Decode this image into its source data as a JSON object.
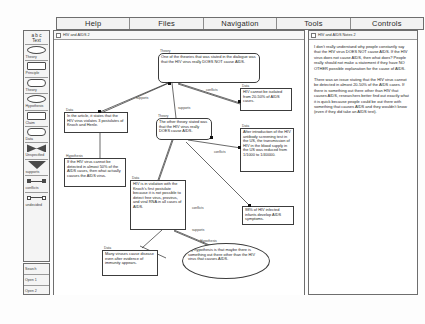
{
  "menubar": {
    "items": [
      {
        "label": "Help",
        "name": "menu-help"
      },
      {
        "label": "Files",
        "name": "menu-files"
      },
      {
        "label": "Navigation",
        "name": "menu-navigation"
      },
      {
        "label": "Tools",
        "name": "menu-tools"
      },
      {
        "label": "Controls",
        "name": "menu-controls"
      }
    ]
  },
  "palette": {
    "header": "a b c\nText",
    "header_line1": "a b c",
    "header_line2": "Text",
    "items": [
      {
        "label": "Theory",
        "shape": "oval"
      },
      {
        "label": "Principle",
        "shape": "rect"
      },
      {
        "label": "Theory",
        "shape": "round"
      },
      {
        "label": "Hypothesis",
        "shape": "oval"
      },
      {
        "label": "Claim",
        "shape": "rect"
      },
      {
        "label": "Data",
        "shape": "round"
      },
      {
        "label": "Unspecified",
        "shape": "bowtie"
      },
      {
        "label": "supports",
        "shape": "triangle"
      },
      {
        "label": "conflicts",
        "shape": "link-filled"
      },
      {
        "label": "undecided",
        "shape": "link-open"
      }
    ],
    "bottom_items": [
      {
        "label": "Search"
      },
      {
        "label": "Open 1"
      },
      {
        "label": "Open 2"
      }
    ]
  },
  "map_window": {
    "title": "HIV and AIDS 2",
    "nodes": [
      {
        "id": "theory-not-cause",
        "tag": "Theory",
        "shape": "rounded",
        "text": "One of the theories that was stated in the dialogue was that the HIV virus really DOES NOT cause AIDS."
      },
      {
        "id": "data-article-postulates",
        "tag": "Data",
        "shape": "rect",
        "text": "In the article, it states that the HIV virus violates 3 postulates of Knoch and Henle."
      },
      {
        "id": "theory-does-cause",
        "tag": "Theory",
        "shape": "rounded",
        "text": "The other theory stated was that the HIV virus really DOES cause AIDS."
      },
      {
        "id": "data-hiv-not-isolated",
        "tag": "Data",
        "shape": "rect",
        "text": "HIV cannot be isolated from 20-50% of AIDS cases."
      },
      {
        "id": "data-antibody-screening",
        "tag": "Data",
        "shape": "rect",
        "text": "After introduction of the HIV antibody screening test in the US, the transmission of HIV in the blood supply in the US was reduced from 1/1000 to 1/40000."
      },
      {
        "id": "data-infants",
        "tag": "Data",
        "shape": "rect",
        "text": "98% of HIV infected infants develop AIDS symptoms."
      },
      {
        "id": "hypothesis-what-causes",
        "tag": "Hypothesis",
        "shape": "rect",
        "text": "If the HIV virus cannot be detected in almost 50% of the AIDS cases, then what actually causes the AIDS virus."
      },
      {
        "id": "data-first-postulate",
        "tag": "Data",
        "shape": "rect",
        "text": "HIV is in violation with the Knoch's first postulate because it is not possible to detect free virus, provirus, and viral RNA in all cases of AIDS."
      },
      {
        "id": "data-many-viruses",
        "tag": "Data",
        "shape": "rect",
        "text": "Many viruses cause disease even after evidence of immunity appears."
      },
      {
        "id": "hypothesis-something-else",
        "tag": "Hypothesis",
        "shape": "ellipse",
        "text": "My hypothesis is that maybe there is something out there other than the HIV virus that causes AIDS."
      }
    ],
    "link_labels": [
      "supports",
      "conflicts",
      "supports",
      "conflicts",
      "supports",
      "conflicts"
    ]
  },
  "notes_window": {
    "title": "HIV and AIDS Notes 2",
    "paragraphs": [
      "I don't really understand why people constantly say that the HIV virus DOES NOT cause AIDS. If the HIV virus does not cause AIDS, then what does? People really should not make a statement if they have NO OTHER possible explanation for the cause of AIDS.",
      "There was an issue stating that the HIV virus cannot be detected in almost 20-50% of the AIDS cases. If there is something out there other than HIV that causes AIDS, researchers better find out exactly what it is quick because people could be out there with something that causes AIDS and they wouldn't know (even if they did take an AIDS test)."
    ]
  },
  "colors": {
    "border": "#3c3c3c",
    "window_border": "#6e6e6e",
    "menu_bg": "#f2f2f2",
    "canvas_bg": "#ffffff",
    "text": "#1d1d1d"
  }
}
